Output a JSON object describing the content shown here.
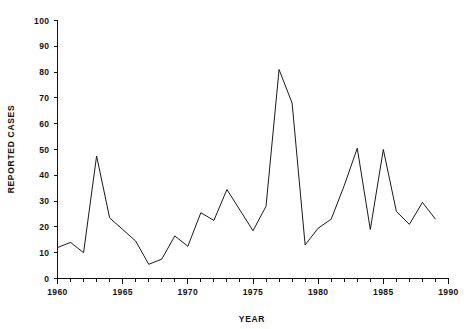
{
  "chart_data": {
    "type": "line",
    "title": "",
    "xlabel": "YEAR",
    "ylabel": "REPORTED CASES",
    "xlim": [
      1960,
      1990
    ],
    "ylim": [
      0,
      100
    ],
    "grid": false,
    "legend": "none",
    "x_tick_labels": [
      "1960",
      "1965",
      "1970",
      "1975",
      "1980",
      "1985",
      "1990"
    ],
    "x_tick_values": [
      1960,
      1965,
      1970,
      1975,
      1980,
      1985,
      1990
    ],
    "x_minor_tick_interval": 1,
    "y_tick_labels": [
      "0",
      "10",
      "20",
      "30",
      "40",
      "50",
      "60",
      "70",
      "80",
      "90",
      "100"
    ],
    "y_tick_values": [
      0,
      10,
      20,
      30,
      40,
      50,
      60,
      70,
      80,
      90,
      100
    ],
    "line_color": "#1a1a1a",
    "background_color": "#ffffff",
    "x": [
      1960,
      1961,
      1962,
      1963,
      1964,
      1965,
      1966,
      1967,
      1968,
      1969,
      1970,
      1971,
      1972,
      1973,
      1974,
      1975,
      1976,
      1977,
      1978,
      1979,
      1980,
      1981,
      1982,
      1983,
      1984,
      1985,
      1986,
      1987,
      1988,
      1989
    ],
    "values": [
      12,
      14,
      10,
      47.5,
      23.5,
      19,
      14.5,
      5.5,
      7.5,
      16.5,
      12.5,
      25.5,
      22.5,
      34.5,
      26.5,
      18.5,
      28,
      81,
      68,
      13,
      19.5,
      23,
      36,
      50.5,
      19,
      50,
      26,
      21,
      29.5,
      23
    ]
  }
}
